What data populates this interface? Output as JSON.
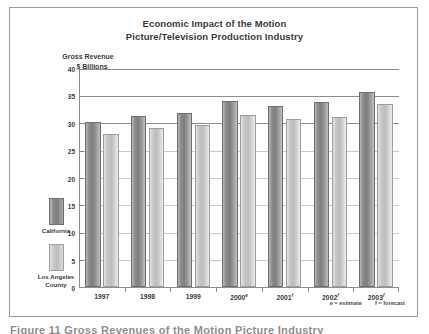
{
  "chart_data": {
    "type": "bar",
    "title": "Economic Impact of the Motion Picture/Television Production Industry",
    "title_lines": [
      "Economic Impact of the Motion",
      "Picture/Television Production Industry"
    ],
    "ylabel_lines": [
      "Gross Revenue",
      "$ Billions"
    ],
    "ylabel": "Gross Revenue $ Billions",
    "xlabel": "",
    "ylim": [
      0,
      40
    ],
    "ytick_values": [
      0,
      5,
      10,
      15,
      20,
      25,
      30,
      35,
      40
    ],
    "ytick_labels": [
      "0",
      "5",
      "10",
      "15",
      "20",
      "25",
      "30",
      "35",
      "40"
    ],
    "grid": "horizontal-major",
    "legend_position": "left-outside",
    "categories": [
      "1997",
      "1998",
      "1999",
      "2000",
      "2001",
      "2002",
      "2003"
    ],
    "category_labels": [
      {
        "year": "1997",
        "marker": ""
      },
      {
        "year": "1998",
        "marker": ""
      },
      {
        "year": "1999",
        "marker": ""
      },
      {
        "year": "2000",
        "marker": "e"
      },
      {
        "year": "2001",
        "marker": "f"
      },
      {
        "year": "2002",
        "marker": "f"
      },
      {
        "year": "2003",
        "marker": "f"
      }
    ],
    "series": [
      {
        "name": "California",
        "color": "#8c8c8c",
        "values": [
          30.2,
          31.2,
          31.8,
          33.9,
          33.0,
          33.8,
          35.7
        ]
      },
      {
        "name": "Los Angeles County",
        "color": "#c6c6c6",
        "values": [
          28.0,
          29.0,
          29.6,
          31.4,
          30.6,
          31.1,
          33.4
        ]
      }
    ],
    "annotations": {
      "footnote_estimate": "e = estimate",
      "footnote_forecast": "f = forecast"
    }
  },
  "legend": {
    "entries": [
      {
        "label_lines": [
          "California"
        ],
        "swatch": "ca"
      },
      {
        "label_lines": [
          "Los Angeles",
          "County"
        ],
        "swatch": "la"
      }
    ]
  },
  "caption": {
    "text": "Figure 11 Gross Revenues of the Motion Picture Industry"
  },
  "colors": {
    "california_bar": "#8c8c8c",
    "los_angeles_bar": "#c6c6c6",
    "axis": "#8d8d8d",
    "text": "#3a3a3a",
    "frame_border": "#9a9a9a",
    "background": "#ffffff"
  }
}
